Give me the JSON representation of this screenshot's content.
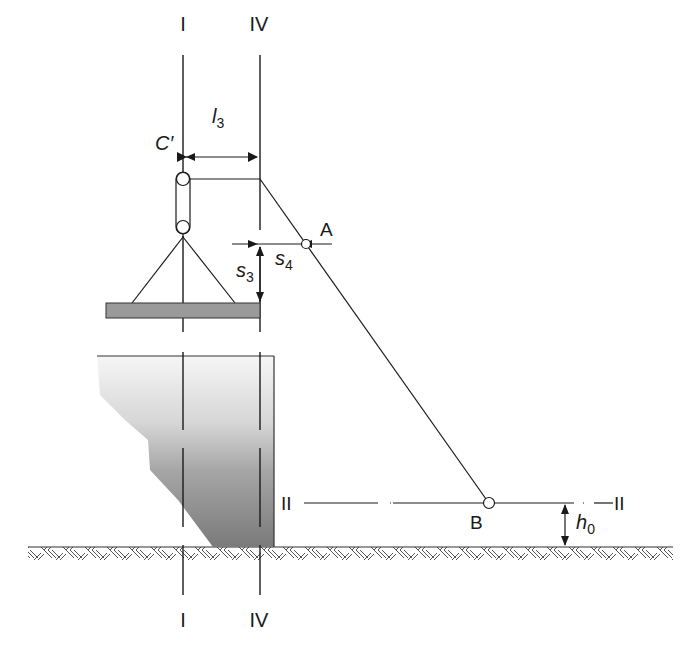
{
  "diagram": {
    "type": "engineering-schematic",
    "axes": {
      "I_top": "I",
      "IV_top": "IV",
      "I_bottom": "I",
      "IV_bottom": "IV",
      "II_left": "II",
      "II_right": "II"
    },
    "labels": {
      "pulley": "C′",
      "point_a": "A",
      "point_b": "B"
    },
    "dimensions": {
      "l3": {
        "symbol": "l",
        "sub": "3"
      },
      "s3": {
        "symbol": "s",
        "sub": "3"
      },
      "s4": {
        "symbol": "s",
        "sub": "4"
      },
      "h0": {
        "symbol": "h",
        "sub": "0"
      }
    },
    "colors": {
      "line": "#1a1a1a",
      "slab_fill": "#9a9a9a",
      "wall_light": "#f4f4f4",
      "wall_dark": "#7d7d7d",
      "hatch": "#555555",
      "background": "#ffffff"
    }
  }
}
